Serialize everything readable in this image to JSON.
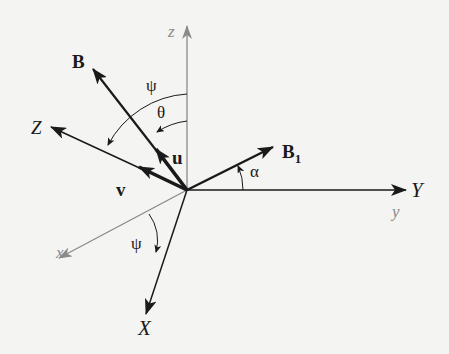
{
  "diagram": {
    "type": "3D coordinate rotation diagram",
    "origin": [
      187,
      190
    ],
    "axes_fixed": [
      {
        "name": "z",
        "label": "z",
        "color": "#8a8a8a",
        "direction": "up"
      },
      {
        "name": "y",
        "label": "y",
        "color": "#8a8a8a",
        "direction": "right"
      },
      {
        "name": "x",
        "label": "x",
        "color": "#8a8a8a",
        "direction": "down-left"
      }
    ],
    "axes_rotated": [
      {
        "name": "Z",
        "label": "Z",
        "color": "#1a1a1a"
      },
      {
        "name": "Y",
        "label": "Y",
        "color": "#1a1a1a"
      },
      {
        "name": "X",
        "label": "X",
        "color": "#1a1a1a"
      }
    ],
    "vectors": [
      {
        "name": "B",
        "label": "B",
        "bold": true
      },
      {
        "name": "B1",
        "label": "B",
        "subscript": "1",
        "bold": true
      },
      {
        "name": "u",
        "label": "u",
        "bold": true
      },
      {
        "name": "v",
        "label": "v",
        "bold": true
      }
    ],
    "angles": [
      {
        "name": "psi-top",
        "label": "ψ",
        "between": [
          "z",
          "Z"
        ]
      },
      {
        "name": "theta",
        "label": "θ",
        "between": [
          "z",
          "B"
        ]
      },
      {
        "name": "alpha",
        "label": "α",
        "between": [
          "Y",
          "B1"
        ]
      },
      {
        "name": "psi-bottom",
        "label": "ψ",
        "between": [
          "x",
          "X"
        ]
      }
    ]
  },
  "labels": {
    "z": "z",
    "y": "y",
    "x": "x",
    "Z": "Z",
    "Y": "Y",
    "X": "X",
    "B": "B",
    "B1_main": "B",
    "B1_sub": "1",
    "u": "u",
    "v": "v",
    "psi_top": "ψ",
    "theta": "θ",
    "alpha": "α",
    "psi_bottom": "ψ"
  },
  "colors": {
    "ink": "#1a1a1a",
    "gray_axis": "#8a8a8a",
    "background": "#f4f4f2"
  }
}
